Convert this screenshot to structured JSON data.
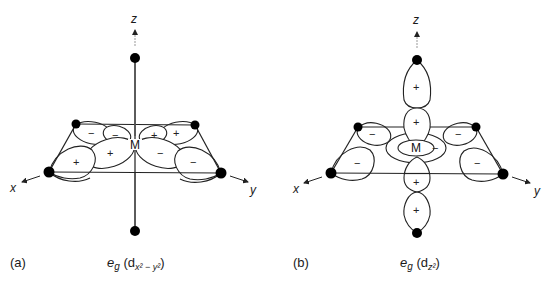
{
  "panels": [
    {
      "id": "a",
      "tag": "(a)",
      "caption": {
        "main": "e",
        "sub1": "g",
        "paren_open": " (d",
        "orbital_sub": "x² − y²",
        "paren_close": ")"
      },
      "axes": {
        "z": "z",
        "x": "x",
        "y": "y"
      },
      "center_label": "M",
      "lobe_signs": {
        "back_left": "−",
        "back_inner_left": "−",
        "back_inner_right": "+",
        "back_right": "+",
        "front_left": "+",
        "front_inner_left": "+",
        "front_inner_right": "−",
        "front_right": "−"
      },
      "ligands": 6
    },
    {
      "id": "b",
      "tag": "(b)",
      "caption": {
        "main": "e",
        "sub1": "g",
        "paren_open": " (d",
        "orbital_sub": "z²",
        "paren_close": ")"
      },
      "axes": {
        "z": "z",
        "x": "x",
        "y": "y"
      },
      "center_label": "M",
      "lobe_signs": {
        "top_outer": "+",
        "top_inner": "+",
        "bottom_inner": "+",
        "bottom_outer": "+",
        "torus": "−",
        "back_left": "−",
        "back_right": "−",
        "front_left": "−",
        "front_right": "−"
      },
      "ligands": 6
    }
  ]
}
